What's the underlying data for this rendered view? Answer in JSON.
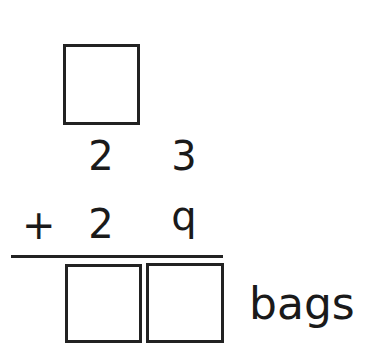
{
  "problem": {
    "carry_box": {
      "value": ""
    },
    "addend1": {
      "tens": "2",
      "ones": "3"
    },
    "addend2": {
      "operator": "+",
      "tens": "2",
      "ones": "q"
    },
    "answer": {
      "tens": "",
      "ones": "",
      "unit": "bags"
    }
  }
}
